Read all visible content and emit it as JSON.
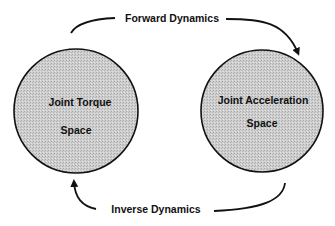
{
  "diagram": {
    "nodes": [
      {
        "id": "torque",
        "lines": [
          "Joint Torque",
          "Space"
        ],
        "shape": "circle",
        "fill": "#c8c8c8"
      },
      {
        "id": "accel",
        "lines": [
          "Joint Acceleration",
          "Space"
        ],
        "shape": "circle",
        "fill": "#c8c8c8"
      }
    ],
    "edges": [
      {
        "from": "torque",
        "to": "accel",
        "label": "Forward Dynamics",
        "position": "top"
      },
      {
        "from": "accel",
        "to": "torque",
        "label": "Inverse Dynamics",
        "position": "bottom"
      }
    ]
  },
  "colors": {
    "stroke": "#111111",
    "fill": "#c8c8c8",
    "background": "#ffffff"
  }
}
